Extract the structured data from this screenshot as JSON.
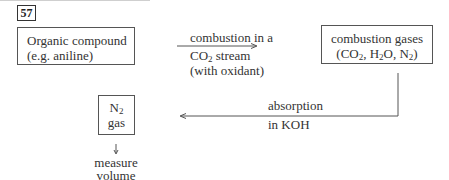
{
  "question_number": "57",
  "nodes": {
    "organic": {
      "line1": "Organic compound",
      "line2": "(e.g. aniline)"
    },
    "gases": {
      "line1": "combustion gases",
      "line2_pre": "(CO",
      "line2_sub1": "2",
      "line2_mid1": ", H",
      "line2_sub2": "2",
      "line2_mid2": "O, N",
      "line2_sub3": "2",
      "line2_post": ")"
    },
    "n2": {
      "line1_pre": "N",
      "line1_sub": "2",
      "line2": "gas"
    }
  },
  "edges": {
    "combustion": {
      "line1": "combustion in a",
      "line2_pre": "CO",
      "line2_sub": "2",
      "line2_post": " stream",
      "line3": "(with oxidant)"
    },
    "absorption": {
      "line1": "absorption",
      "line2": "in KOH"
    },
    "measure": {
      "line1": "measure",
      "line2": "volume"
    }
  }
}
